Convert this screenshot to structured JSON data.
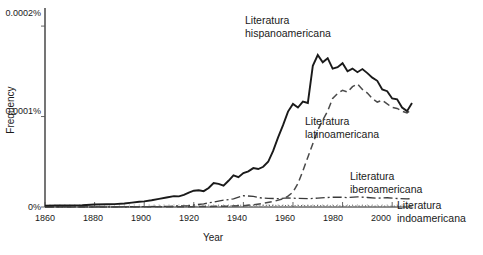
{
  "chart_data": {
    "type": "line",
    "title": "",
    "xlabel": "Year",
    "ylabel": "Frequency",
    "xlim": [
      1860,
      2008
    ],
    "ylim": [
      0,
      0.00022
    ],
    "grid": false,
    "legend_position": "inline-annotations",
    "xticks": [
      "1860",
      "1880",
      "1900",
      "1920",
      "1940",
      "1960",
      "1980",
      "2000"
    ],
    "xtick_values": [
      1860,
      1880,
      1900,
      1920,
      1940,
      1960,
      1980,
      2000
    ],
    "yticks": [
      "0%",
      "0.0001%",
      "0.0002%"
    ],
    "ytick_values": [
      0,
      0.0001,
      0.0002
    ],
    "series": [
      {
        "name": "Literatura hispanoamericana",
        "style": "solid",
        "color": "#1a1a1a",
        "x": [
          1860,
          1865,
          1870,
          1875,
          1880,
          1885,
          1888,
          1892,
          1895,
          1898,
          1900,
          1903,
          1906,
          1909,
          1912,
          1914,
          1916,
          1918,
          1920,
          1922,
          1924,
          1926,
          1928,
          1930,
          1932,
          1934,
          1936,
          1938,
          1940,
          1942,
          1944,
          1946,
          1948,
          1950,
          1952,
          1954,
          1956,
          1958,
          1960,
          1962,
          1964,
          1966,
          1968,
          1970,
          1972,
          1974,
          1976,
          1978,
          1980,
          1982,
          1984,
          1986,
          1988,
          1990,
          1992,
          1994,
          1996,
          1998,
          2000,
          2002,
          2004,
          2006,
          2008
        ],
        "y": [
          1.5e-06,
          1.6e-06,
          1.8e-06,
          2e-06,
          2.8e-06,
          3e-06,
          3.2e-06,
          3.8e-06,
          4.8e-06,
          5.8e-06,
          6.2e-06,
          7.5e-06,
          9e-06,
          1.05e-05,
          1.2e-05,
          1.18e-05,
          1.35e-05,
          1.6e-05,
          1.8e-05,
          1.85e-05,
          1.75e-05,
          2.1e-05,
          2.65e-05,
          2.55e-05,
          2.35e-05,
          2.9e-05,
          3.5e-05,
          3.3e-05,
          3.75e-05,
          3.95e-05,
          4.3e-05,
          4.2e-05,
          4.45e-05,
          5e-05,
          6.2e-05,
          7.7e-05,
          9.05e-05,
          0.0001055,
          0.000114,
          0.00011,
          0.0001165,
          0.000115,
          0.000156,
          0.000168,
          0.00016,
          0.0001645,
          0.000153,
          0.0001545,
          0.000159,
          0.00015,
          0.000153,
          0.000149,
          0.0001525,
          0.000148,
          0.000143,
          0.0001395,
          0.00013,
          0.000128,
          0.00012,
          0.000119,
          0.00011,
          0.000106,
          0.000115
        ]
      },
      {
        "name": "Literatura latinoamericana",
        "style": "dashed",
        "color": "#4a4a4a",
        "x": [
          1860,
          1900,
          1920,
          1930,
          1935,
          1940,
          1944,
          1948,
          1952,
          1956,
          1958,
          1960,
          1962,
          1964,
          1966,
          1968,
          1970,
          1972,
          1974,
          1976,
          1978,
          1980,
          1982,
          1984,
          1986,
          1988,
          1990,
          1992,
          1994,
          1996,
          1998,
          2000,
          2002,
          2004,
          2006,
          2008
        ],
        "y": [
          0.0,
          2e-07,
          4e-07,
          8e-07,
          1e-06,
          1.5e-06,
          2.5e-06,
          4e-06,
          6e-06,
          9e-06,
          1.2e-05,
          1.65e-05,
          2.6e-05,
          4e-05,
          5.5e-05,
          7e-05,
          8.5e-05,
          9.6e-05,
          0.000106,
          0.00012,
          0.0001255,
          0.000129,
          0.000127,
          0.000133,
          0.000136,
          0.00013,
          0.000126,
          0.00012,
          0.000116,
          0.000118,
          0.000114,
          0.00011,
          0.000109,
          0.000106,
          0.000104,
          0.000108
        ]
      },
      {
        "name": "Literatura iberoamericana",
        "style": "dash-dot",
        "color": "#3a3a3a",
        "x": [
          1860,
          1890,
          1900,
          1910,
          1918,
          1924,
          1928,
          1932,
          1936,
          1940,
          1944,
          1946,
          1948,
          1950,
          1954,
          1958,
          1962,
          1966,
          1970,
          1974,
          1978,
          1982,
          1986,
          1990,
          1994,
          1998,
          2002,
          2006,
          2008
        ],
        "y": [
          0.0,
          2e-07,
          4e-07,
          8e-07,
          1.6e-06,
          3.5e-06,
          5.5e-06,
          7.5e-06,
          9e-06,
          1.25e-05,
          1.18e-05,
          1.04e-05,
          9.8e-06,
          9.6e-06,
          9.2e-06,
          1e-05,
          9.5e-06,
          9.2e-06,
          9.8e-06,
          1.05e-05,
          1.1e-05,
          1.04e-05,
          1.12e-05,
          1.05e-05,
          9.8e-06,
          1.02e-05,
          9.4e-06,
          9e-06,
          9.2e-06
        ]
      },
      {
        "name": "Literatura indoamericana",
        "style": "dotted",
        "color": "#666666",
        "x": [
          1860,
          1880,
          1900,
          1910,
          1920,
          1930,
          1940,
          1950,
          1960,
          1970,
          1980,
          1990,
          2000,
          2008
        ],
        "y": [
          0.0,
          1e-07,
          2e-07,
          4e-07,
          8e-07,
          1.2e-06,
          2e-06,
          1.8e-06,
          1.6e-06,
          1.5e-06,
          1.4e-06,
          1.2e-06,
          1e-06,
          1e-06
        ]
      }
    ],
    "annotations": [
      {
        "id": "hispano",
        "line1": "Literatura",
        "line2": "hispanoamericana"
      },
      {
        "id": "latino",
        "line1": "Literatura",
        "line2": "latinoamericana"
      },
      {
        "id": "ibero",
        "line1": "Literatura",
        "line2": "iberoamericana"
      },
      {
        "id": "indo",
        "line1": "Literatura",
        "line2": "indoamericana"
      }
    ]
  },
  "axes": {
    "ylabel": "Frequency",
    "xlabel": "Year",
    "ytick_0": "0%",
    "ytick_1": "0.0001%",
    "ytick_2": "0.0002%",
    "xtick_0": "1860",
    "xtick_1": "1880",
    "xtick_2": "1900",
    "xtick_3": "1920",
    "xtick_4": "1940",
    "xtick_5": "1960",
    "xtick_6": "1980",
    "xtick_7": "2000"
  },
  "labels": {
    "hispano_1": "Literatura",
    "hispano_2": "hispanoamericana",
    "latino_1": "Literatura",
    "latino_2": "latinoamericana",
    "ibero_1": "Literatura",
    "ibero_2": "iberoamericana",
    "indo_1": "Literatura",
    "indo_2": "indoamericana"
  }
}
